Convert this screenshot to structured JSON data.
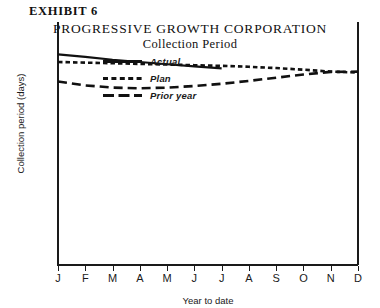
{
  "exhibit": {
    "label": "EXHIBIT 6"
  },
  "header": {
    "title": "PROGRESSIVE GROWTH CORPORATION",
    "subtitle": "Collection Period"
  },
  "chart_data": {
    "type": "line",
    "title": "PROGRESSIVE GROWTH CORPORATION",
    "subtitle": "Collection Period",
    "xlabel": "Year to date",
    "ylabel": "Collection period (days)",
    "grid": false,
    "legend_position": "upper-left-inside",
    "categories": [
      "J",
      "F",
      "M",
      "A",
      "M",
      "J",
      "J",
      "A",
      "S",
      "O",
      "N",
      "D"
    ],
    "x_tick_labels": [
      "J",
      "F",
      "M",
      "A",
      "M",
      "J",
      "J",
      "A",
      "S",
      "O",
      "N",
      "D"
    ],
    "y_axis_ticks_shown": false,
    "series": [
      {
        "name": "Actual",
        "style": "solid",
        "color": "#111111",
        "partial": true,
        "last_point_category": "J",
        "values": [
          50.0,
          49.2,
          48.3,
          47.6,
          46.9,
          46.2,
          45.6,
          null,
          null,
          null,
          null,
          null
        ]
      },
      {
        "name": "Plan",
        "style": "dotted",
        "color": "#111111",
        "partial": false,
        "values": [
          47.6,
          47.4,
          47.2,
          47.0,
          46.8,
          46.6,
          46.4,
          46.1,
          45.7,
          45.2,
          44.6,
          44.3
        ]
      },
      {
        "name": "Prior year",
        "style": "dashed",
        "color": "#111111",
        "partial": false,
        "values": [
          41.5,
          40.3,
          39.6,
          39.4,
          39.6,
          40.1,
          40.8,
          41.7,
          42.7,
          43.7,
          44.5,
          44.6
        ]
      }
    ]
  },
  "legend": {
    "items": [
      {
        "label": "Actual",
        "style": "solid"
      },
      {
        "label": "Plan",
        "style": "dotted"
      },
      {
        "label": "Prior year",
        "style": "dashed"
      }
    ]
  },
  "axes": {
    "x_title": "Year to date",
    "y_title": "Collection period (days)"
  }
}
